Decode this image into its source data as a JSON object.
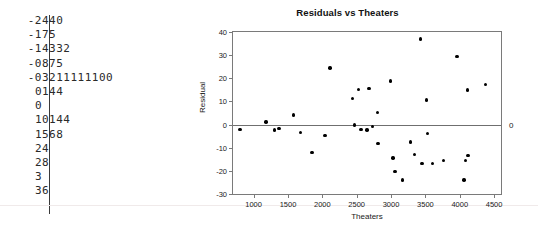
{
  "stemleaf": {
    "name": "stem-and-leaf-plot",
    "rows": [
      {
        "stem": "-2",
        "leaf": "440"
      },
      {
        "stem": "-1",
        "leaf": "75"
      },
      {
        "stem": "-1",
        "leaf": "4332"
      },
      {
        "stem": "-0",
        "leaf": "875"
      },
      {
        "stem": "-0",
        "leaf": "3211111100"
      },
      {
        "stem": "0",
        "leaf": "144"
      },
      {
        "stem": "0",
        "leaf": ""
      },
      {
        "stem": "1",
        "leaf": "0144"
      },
      {
        "stem": "1",
        "leaf": "568"
      },
      {
        "stem": "2",
        "leaf": "4"
      },
      {
        "stem": "2",
        "leaf": "8"
      },
      {
        "stem": "3",
        "leaf": ""
      },
      {
        "stem": "3",
        "leaf": "6"
      }
    ]
  },
  "chart_data": {
    "type": "scatter",
    "title": "Residuals vs Theaters",
    "xlabel": "Theaters",
    "ylabel": "Residual",
    "xlim": [
      700,
      4600
    ],
    "ylim": [
      -30,
      40
    ],
    "grid": false,
    "legend": null,
    "xticks": [
      1000,
      1500,
      2000,
      2500,
      3000,
      3500,
      4000,
      4500
    ],
    "xtick_labels": [
      "1000",
      "1500",
      "2000",
      "2500",
      "3000",
      "3500",
      "4000",
      "4500"
    ],
    "yticks": [
      -30,
      -20,
      -10,
      0,
      10,
      20,
      30,
      40
    ],
    "ytick_labels": [
      "-30",
      "-20",
      "-10",
      "0",
      "10",
      "20",
      "30",
      "40"
    ],
    "reference_line": {
      "y": 0,
      "label": "0",
      "position": "right"
    },
    "x": [
      800,
      1180,
      1300,
      1370,
      1580,
      1680,
      1850,
      2040,
      2110,
      2440,
      2470,
      2530,
      2560,
      2650,
      2680,
      2730,
      2800,
      2810,
      2990,
      3030,
      3060,
      3170,
      3280,
      3340,
      3430,
      3450,
      3520,
      3530,
      3600,
      3760,
      3960,
      4060,
      4080,
      4110,
      4120,
      4370
    ],
    "y": [
      -2.2,
      1.1,
      -2.3,
      -1.8,
      4.1,
      -3.5,
      -12.1,
      -4.7,
      24.5,
      11.4,
      -0.1,
      15.1,
      -2.1,
      -2.3,
      15.7,
      -0.9,
      5.1,
      -8.2,
      18.8,
      -14.4,
      -20.3,
      -23.9,
      -7.6,
      -12.8,
      37.0,
      -16.9,
      10.6,
      -3.8,
      -16.9,
      -15.6,
      29.4,
      -24.0,
      -15.6,
      14.9,
      -13.3,
      17.3
    ]
  }
}
